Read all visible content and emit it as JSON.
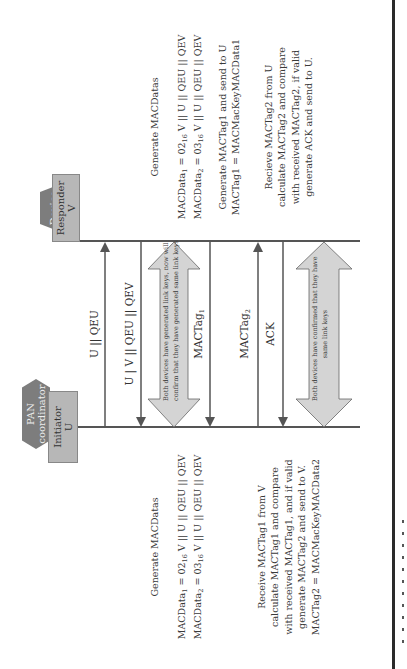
{
  "diagram": {
    "orientation": "rotated-90-ccw",
    "initiator": {
      "tag_line1": "PAN",
      "tag_line2": "coordinator",
      "box_line1": "Initiator",
      "box_line2": "U"
    },
    "responder": {
      "tag_line1": "Device",
      "box_line1": "Responder",
      "box_line2": "V"
    },
    "messages": [
      {
        "label": "U || QEU",
        "direction": "U to V"
      },
      {
        "label": "U |  V || QEU || QEV",
        "direction": "V to U"
      },
      {
        "label": "MACTag",
        "sub": "1",
        "direction": "V to U"
      },
      {
        "label": "MACTag",
        "sub": "2",
        "direction": "U to V"
      },
      {
        "label": "ACK",
        "direction": "V to U"
      }
    ],
    "block_arrows": [
      {
        "line1": "Both devices have generated link keys, now will",
        "line2": "confirm that they have generated same link keys"
      },
      {
        "line1": "Both devices have confirmed that they have",
        "line2": "same link keys"
      }
    ],
    "initiator_notes": {
      "gen_title": "Generate MACDatas",
      "gen_line1": {
        "pre": "MACData",
        "s1": "1",
        "mid": " = 02",
        "s2": "16",
        "post": " V || U || QEU || QEV"
      },
      "gen_line2": {
        "pre": "MACData",
        "s1": "2",
        "mid": " = 03",
        "s2": "16",
        "post": " V || U || QEU || QEV"
      },
      "recv_lines": [
        "Receive MACTag1 from V",
        "calculate  MACTag1 and compare",
        "with received MACTag1, and if valid",
        "generate MACTag2 and send to V.",
        "MACTag2 = MACMacKeyMACData2"
      ]
    },
    "responder_notes": {
      "gen_title": "Generate MACDatas",
      "gen_line1": {
        "pre": "MACData",
        "s1": "1",
        "mid": " = 02",
        "s2": "16",
        "post": " V || U || QEU || QEV"
      },
      "gen_line2": {
        "pre": "MACData",
        "s1": "2",
        "mid": " = 03",
        "s2": "16",
        "post": " V || U || QEU || QEV"
      },
      "tag_lines": [
        "Generate MACTag1 and send to U",
        "MACTag1 = MACMacKeyMACData1"
      ],
      "recv_lines": [
        "Recieve MACTag2 from U",
        "calculate MACTag2 and compare",
        "with received MACTag2, if valid",
        "generate ACK and send to U."
      ]
    }
  }
}
